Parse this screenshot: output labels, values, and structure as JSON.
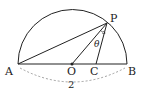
{
  "diagram": {
    "points": {
      "A": {
        "label": "A",
        "x": 18,
        "y": 64
      },
      "B": {
        "label": "B",
        "x": 127,
        "y": 64
      },
      "O": {
        "label": "O",
        "x": 72,
        "y": 64
      },
      "C": {
        "label": "C",
        "x": 96,
        "y": 64
      },
      "P": {
        "label": "P",
        "x": 107,
        "y": 23
      }
    },
    "angle_label": "θ",
    "diameter_label": "2",
    "stroke_color": "#222222",
    "dash_color": "#888888"
  }
}
